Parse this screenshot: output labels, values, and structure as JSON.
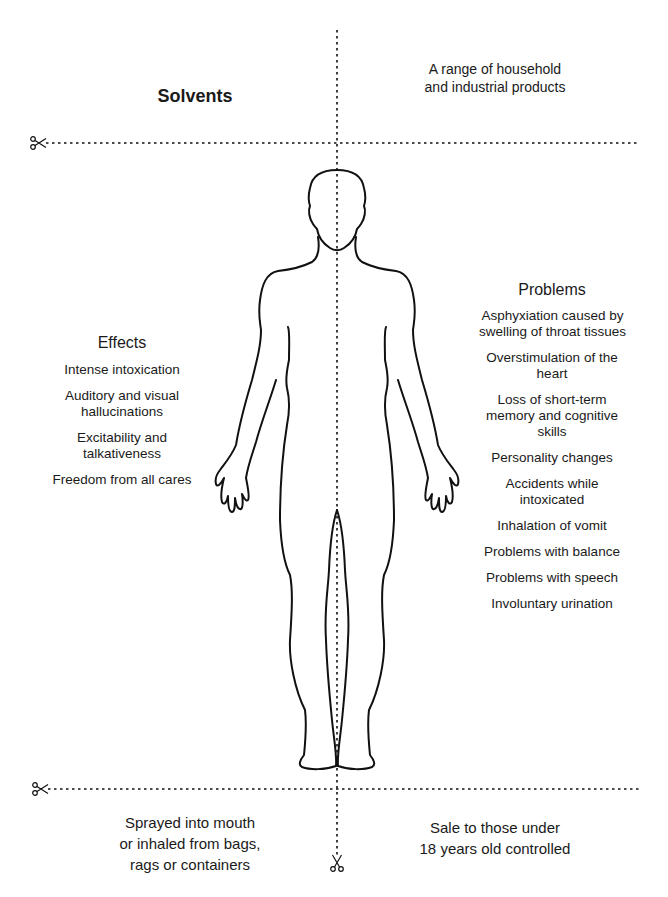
{
  "title": "Solvents",
  "top_right": {
    "lines": [
      "A range of household",
      "and industrial products"
    ]
  },
  "effects": {
    "heading": "Effects",
    "items": [
      "Intense intoxication",
      "Auditory and visual hallucinations",
      "Excitability and talkativeness",
      "Freedom from all cares"
    ]
  },
  "problems": {
    "heading": "Problems",
    "items": [
      "Asphyxiation caused by swelling of throat tissues",
      "Overstimulation of the heart",
      "Loss of short-term memory and cognitive skills",
      "Personality changes",
      "Accidents while intoxicated",
      "Inhalation of vomit",
      "Problems with balance",
      "Problems with speech",
      "Involuntary urination"
    ]
  },
  "bottom_left": {
    "lines": [
      "Sprayed into mouth",
      "or inhaled from bags,",
      "rags or containers"
    ]
  },
  "bottom_right": {
    "lines": [
      "Sale to those under",
      "18 years old controlled"
    ]
  },
  "icons": {
    "cut_marks": [
      "scissors-icon-top-left",
      "scissors-icon-bottom-left",
      "scissors-icon-bottom-center"
    ],
    "figure": "human-body-outline"
  },
  "colors": {
    "line": "#111111",
    "background": "#ffffff"
  }
}
